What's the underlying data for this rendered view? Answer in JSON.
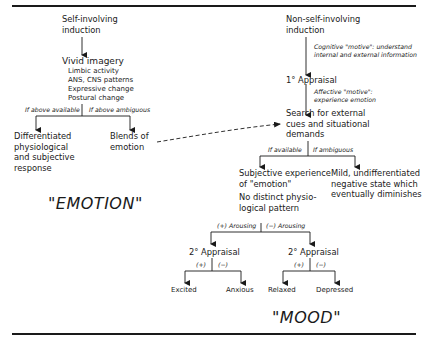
{
  "diagram": {
    "left": {
      "start": [
        "Self-involving",
        "induction"
      ],
      "vivid_imagery": "Vivid imagery",
      "imagery_items": [
        "Limbic activity",
        "ANS, CNS patterns",
        "Expressive change",
        "Postural change"
      ],
      "branch_left_label": "If above available",
      "branch_right_label": "If above ambiguous",
      "outcome_left": [
        "Differentiated",
        "physiological",
        "and subjective",
        "response"
      ],
      "outcome_right": [
        "Blends of",
        "emotion"
      ],
      "category_label": "\"EMOTION\""
    },
    "right": {
      "start": [
        "Non-self-involving",
        "induction"
      ],
      "cognitive_motive": [
        "Cognitive \"motive\": understand",
        "internal and external information"
      ],
      "primary_appraisal": "1° Appraisal",
      "affective_motive": [
        "Affective \"motive\":",
        "experience emotion"
      ],
      "search": [
        "Search for external",
        "cues and situational",
        "demands"
      ],
      "branch_left_label": "If available",
      "branch_right_label": "If ambiguous",
      "subjective": [
        "Subjective experience",
        "of \"emotion\""
      ],
      "no_pattern": [
        "No distinct physio-",
        "logical pattern"
      ],
      "mild": [
        "Mild, undifferentiated",
        "negative state which",
        "eventually diminishes"
      ],
      "arousing_pos": "(+) Arousing",
      "arousing_neg": "(−) Arousing",
      "secondary_appraisal_left": "2° Appraisal",
      "secondary_appraisal_right": "2° Appraisal",
      "pos": "(+)",
      "neg": "(−)",
      "outcomes": [
        "Excited",
        "Anxious",
        "Relaxed",
        "Depressed"
      ],
      "category_label": "\"MOOD\""
    }
  }
}
